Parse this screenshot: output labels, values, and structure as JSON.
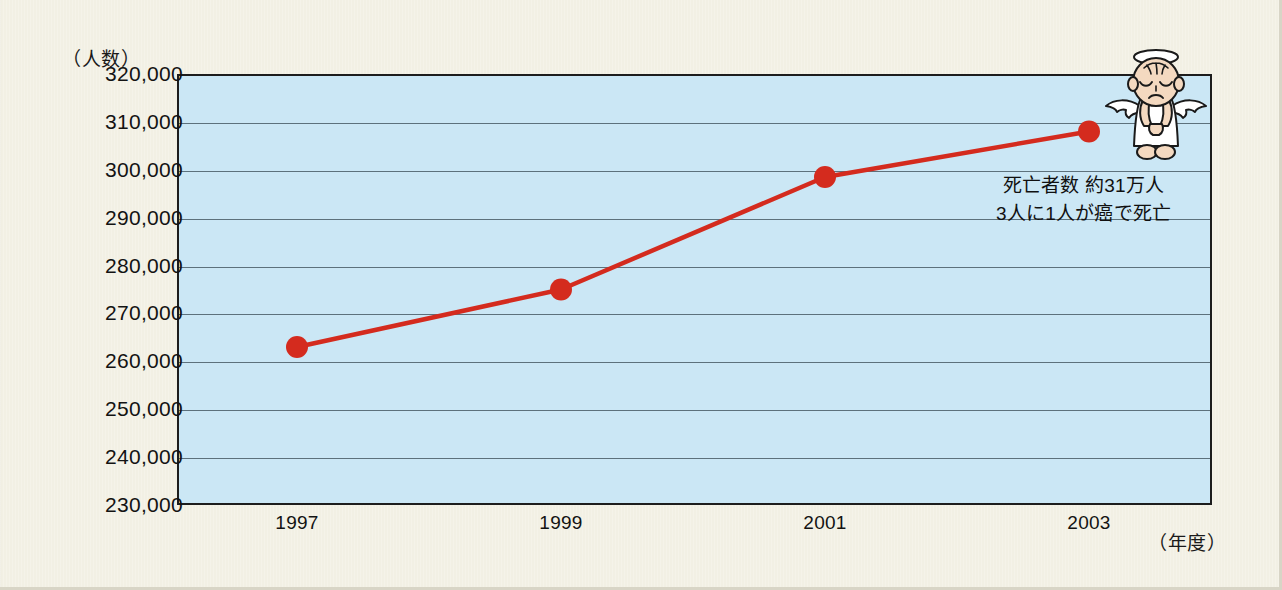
{
  "chart_data": {
    "type": "line",
    "title": "",
    "xlabel": "（年度）",
    "ylabel": "（人数）",
    "categories": [
      "1997",
      "1999",
      "2001",
      "2003"
    ],
    "x": [
      1997,
      1999,
      2001,
      2003
    ],
    "values": [
      263000,
      275000,
      298500,
      308000
    ],
    "series": [
      {
        "name": "死亡者数",
        "values": [
          263000,
          275000,
          298500,
          308000
        ],
        "color": "#d42b1e",
        "marker": "circle"
      }
    ],
    "ylim": [
      230000,
      320000
    ],
    "ytick_step": 10000,
    "ytick_labels": [
      "320,000",
      "310,000",
      "300,000",
      "290,000",
      "280,000",
      "270,000",
      "260,000",
      "250,000",
      "240,000",
      "230,000"
    ],
    "ytick_values": [
      320000,
      310000,
      300000,
      290000,
      280000,
      270000,
      260000,
      250000,
      240000,
      230000
    ],
    "xtick_labels": [
      "1997",
      "1999",
      "2001",
      "2003"
    ],
    "grid": true,
    "grid_axis": "y",
    "legend": false,
    "legend_position": "none",
    "plot_background": "#cbe7f5",
    "figure_background": "#f3f1e5",
    "annotations": [
      {
        "name": "death-toll-note",
        "lines": [
          "死亡者数 約31万人",
          "3人に1人が癌で死亡"
        ],
        "near_point": "2003"
      }
    ]
  },
  "axes": {
    "y_title": "（人数）",
    "x_title": "（年度）"
  },
  "annotation": {
    "line1": "死亡者数 約31万人",
    "line2": "3人に1人が癌で死亡"
  },
  "illustration": {
    "name": "angel-illustration",
    "description": "sad angel with halo and wings"
  }
}
